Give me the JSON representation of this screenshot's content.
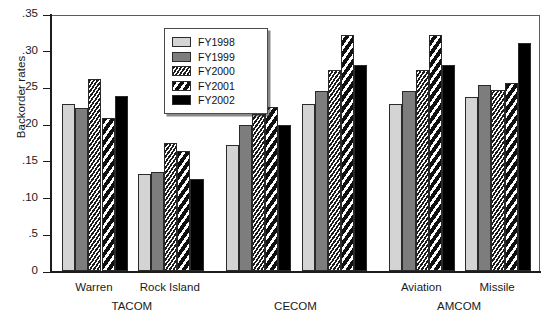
{
  "chart_data": {
    "type": "bar",
    "title": "",
    "xlabel": "",
    "ylabel": "Backorder rates",
    "ylim": [
      0,
      0.35
    ],
    "grid": false,
    "legend_position": "upper-left-inset",
    "ytick_labels": [
      ".35",
      ".30",
      ".25",
      ".20",
      ".15",
      ".10",
      ".5",
      "0"
    ],
    "ytick_values": [
      0.35,
      0.3,
      0.25,
      0.2,
      0.15,
      0.1,
      0.05,
      0.0
    ],
    "categories": [
      "Warren",
      "Rock Island",
      "",
      "",
      "Aviation",
      "Missile"
    ],
    "category_supergroups": [
      {
        "label": "TACOM",
        "members": [
          "Warren",
          "Rock Island"
        ]
      },
      {
        "label": "CECOM",
        "members": [
          "",
          ""
        ]
      },
      {
        "label": "AMCOM",
        "members": [
          "Aviation",
          "Missile"
        ]
      }
    ],
    "series": [
      {
        "name": "FY1998",
        "color": "#d4d4d4",
        "fill": "solid-light-gray",
        "values": [
          0.228,
          0.132,
          0.171,
          0.227,
          0.227,
          0.237
        ]
      },
      {
        "name": "FY1999",
        "color": "#7d7d7d",
        "fill": "solid-mid-gray",
        "values": [
          0.222,
          0.135,
          0.199,
          0.245,
          0.245,
          0.253
        ]
      },
      {
        "name": "FY2000",
        "color": "#2b2b2b",
        "fill": "dense-diagonal-hatch",
        "values": [
          0.262,
          0.175,
          0.214,
          0.274,
          0.274,
          0.247
        ]
      },
      {
        "name": "FY2001",
        "color": "#1c1c1c",
        "fill": "wide-diagonal-stripe",
        "values": [
          0.209,
          0.164,
          0.223,
          0.322,
          0.322,
          0.256
        ]
      },
      {
        "name": "FY2002",
        "color": "#000000",
        "fill": "solid-black",
        "values": [
          0.238,
          0.125,
          0.199,
          0.281,
          0.281,
          0.31
        ]
      }
    ]
  },
  "legend": {
    "items": [
      {
        "label": "FY1998"
      },
      {
        "label": "FY1999"
      },
      {
        "label": "FY2000"
      },
      {
        "label": "FY2001"
      },
      {
        "label": "FY2002"
      }
    ]
  }
}
